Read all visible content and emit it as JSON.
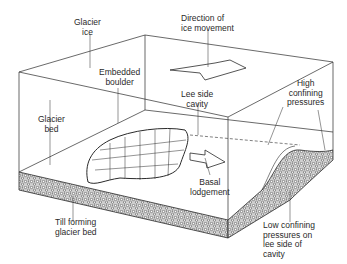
{
  "labels": {
    "glacier_ice": "Glacier\nice",
    "direction": "Direction of\nice movement",
    "embedded_boulder": "Embedded\nboulder",
    "lee_side_cavity": "Lee side\ncavity",
    "high_pressures": "High\nconfining\npressures",
    "glacier_bed": "Glacier\nbed",
    "basal_lodgement": "Basal\nlodgement",
    "till_bed": "Till forming\nglacier bed",
    "low_pressures": "Low confining\npressures on\nlee side of\ncavity"
  },
  "colors": {
    "line": "#2a2a2a",
    "till_fill": "#d9d9d9",
    "background": "#ffffff"
  }
}
